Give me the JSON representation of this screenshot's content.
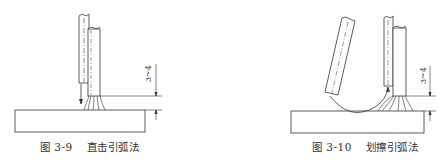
{
  "figures": [
    {
      "id": "fig-3-9",
      "number": "图 3-9",
      "title": "直击引弧法",
      "dimension_label": "3~4"
    },
    {
      "id": "fig-3-10",
      "number": "图 3-10",
      "title": "划擦引弧法",
      "dimension_label": "3~4"
    }
  ],
  "colors": {
    "line": "#333333",
    "background": "#ffffff"
  }
}
